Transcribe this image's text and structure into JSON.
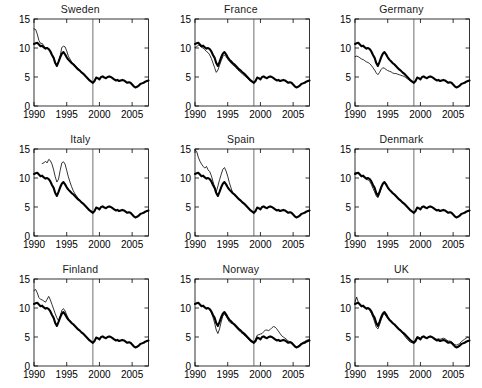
{
  "figure": {
    "panel_order": [
      "Sweden",
      "France",
      "Germany",
      "Italy",
      "Spain",
      "Denmark",
      "Finland",
      "Norway",
      "UK"
    ],
    "rows": 3,
    "cols": 3
  },
  "axes": {
    "xlim": [
      1990,
      2007.5
    ],
    "ylim": [
      0,
      15
    ],
    "xticks": [
      1990,
      1995,
      2000,
      2005
    ],
    "xticklabels": [
      "1990",
      "1995",
      "2000",
      "2005"
    ],
    "yticks": [
      0,
      5,
      10,
      15
    ],
    "yticklabels": [
      "0",
      "5",
      "10",
      "15"
    ],
    "grid": false,
    "box": true,
    "vertical_reference_line": 1999
  },
  "style": {
    "thick_color": "#000000",
    "thin_color": "#000000",
    "vline_color": "#4a4a4a",
    "thick_width": 2.1,
    "thin_width": 0.8,
    "background": "#ffffff"
  },
  "chart_data": {
    "type": "line",
    "title": "",
    "xlabel": "",
    "ylabel": "",
    "xlim": [
      1990,
      2007.5
    ],
    "ylim": [
      0,
      15
    ],
    "legend_position": "none",
    "annotations": [
      {
        "type": "vline",
        "x": 1999,
        "label": "1999"
      }
    ],
    "x": [
      1990.0,
      1990.25,
      1990.5,
      1990.75,
      1991.0,
      1991.25,
      1991.5,
      1991.75,
      1992.0,
      1992.25,
      1992.5,
      1992.75,
      1993.0,
      1993.25,
      1993.5,
      1993.75,
      1994.0,
      1994.25,
      1994.5,
      1994.75,
      1995.0,
      1995.25,
      1995.5,
      1995.75,
      1996.0,
      1996.25,
      1996.5,
      1996.75,
      1997.0,
      1997.25,
      1997.5,
      1997.75,
      1998.0,
      1998.25,
      1998.5,
      1998.75,
      1999.0,
      1999.25,
      1999.5,
      1999.75,
      2000.0,
      2000.25,
      2000.5,
      2000.75,
      2001.0,
      2001.25,
      2001.5,
      2001.75,
      2002.0,
      2002.25,
      2002.5,
      2002.75,
      2003.0,
      2003.25,
      2003.5,
      2003.75,
      2004.0,
      2004.25,
      2004.5,
      2004.75,
      2005.0,
      2005.25,
      2005.5,
      2005.75,
      2006.0,
      2006.25,
      2006.5,
      2006.75,
      2007.0,
      2007.25,
      2007.5
    ],
    "benchmark_series": {
      "name": "benchmark (thick)",
      "note": "identical in all nine panels",
      "values": [
        10.7,
        10.8,
        10.9,
        10.6,
        10.3,
        10.4,
        10.1,
        9.9,
        10.0,
        9.8,
        9.4,
        8.8,
        8.3,
        7.4,
        6.9,
        7.6,
        8.4,
        9.0,
        9.3,
        8.9,
        8.4,
        8.0,
        7.7,
        7.4,
        7.2,
        6.9,
        6.6,
        6.3,
        6.1,
        5.8,
        5.6,
        5.3,
        5.0,
        4.7,
        4.4,
        4.2,
        4.0,
        4.3,
        4.9,
        4.8,
        4.6,
        5.0,
        5.1,
        4.9,
        4.8,
        5.0,
        5.1,
        5.0,
        4.8,
        4.6,
        4.4,
        4.5,
        4.3,
        4.4,
        4.5,
        4.4,
        4.2,
        4.0,
        4.1,
        4.0,
        3.7,
        3.4,
        3.2,
        3.3,
        3.5,
        3.8,
        3.9,
        4.0,
        4.2,
        4.3,
        4.4
      ]
    },
    "panels": [
      {
        "title": "Sweden",
        "series": [
          {
            "name": "Sweden (thin)",
            "x_start": 1990.0,
            "x_end": 1999.0,
            "values": [
              13.3,
              13.2,
              12.4,
              11.3,
              10.8,
              10.8,
              10.4,
              10.0,
              10.1,
              9.9,
              9.5,
              8.9,
              8.4,
              7.5,
              7.0,
              7.7,
              8.6,
              10.1,
              10.3,
              10.2,
              9.5,
              8.6,
              8.1,
              7.6,
              7.3,
              7.0,
              6.7,
              6.4,
              6.2,
              5.9,
              5.7,
              5.4,
              5.1,
              4.8,
              4.5,
              4.3,
              4.0
            ]
          }
        ]
      },
      {
        "title": "France",
        "series": [
          {
            "name": "France (thin)",
            "x_start": 1990.0,
            "x_end": 1999.0,
            "values": [
              10.1,
              10.2,
              10.5,
              10.4,
              10.1,
              10.0,
              9.7,
              9.4,
              9.2,
              8.8,
              8.2,
              7.4,
              6.6,
              5.8,
              6.2,
              7.0,
              7.8,
              8.5,
              8.8,
              8.5,
              8.1,
              7.7,
              7.4,
              7.1,
              6.9,
              6.6,
              6.3,
              6.0,
              5.8,
              5.5,
              5.3,
              5.0,
              4.8,
              4.5,
              4.3,
              4.1,
              4.0
            ]
          }
        ]
      },
      {
        "title": "Germany",
        "series": [
          {
            "name": "Germany (thin)",
            "x_start": 1990.0,
            "x_end": 1999.0,
            "values": [
              8.5,
              8.6,
              8.5,
              8.3,
              8.1,
              8.0,
              7.8,
              7.6,
              7.5,
              7.3,
              7.0,
              6.6,
              6.2,
              5.7,
              5.4,
              5.8,
              6.3,
              6.6,
              6.5,
              6.3,
              6.1,
              6.0,
              5.9,
              5.7,
              5.6,
              5.6,
              5.5,
              5.4,
              5.3,
              5.2,
              5.1,
              4.9,
              4.7,
              4.5,
              4.3,
              4.1,
              4.0
            ]
          }
        ]
      },
      {
        "title": "Italy",
        "series": [
          {
            "name": "Italy (thin)",
            "x_start": 1991.25,
            "x_end": 1999.0,
            "values": [
              12.5,
              12.6,
              12.9,
              12.6,
              13.2,
              13.0,
              12.4,
              11.4,
              10.2,
              9.3,
              9.8,
              11.3,
              12.6,
              12.8,
              12.4,
              11.3,
              10.2,
              9.3,
              8.5,
              7.8,
              7.3,
              6.9,
              6.5,
              6.2,
              5.9,
              5.6,
              5.3,
              5.0,
              4.8,
              4.5,
              4.3,
              4.1
            ]
          }
        ]
      },
      {
        "title": "Spain",
        "series": [
          {
            "name": "Spain (thin)",
            "x_start": 1990.0,
            "x_end": 1999.0,
            "values": [
              14.8,
              14.6,
              13.6,
              12.9,
              12.4,
              12.0,
              11.7,
              12.0,
              11.4,
              11.1,
              10.4,
              9.4,
              8.4,
              7.6,
              8.6,
              9.7,
              10.6,
              11.5,
              11.8,
              11.2,
              10.3,
              9.2,
              8.3,
              7.5,
              7.1,
              6.8,
              6.5,
              6.2,
              6.0,
              5.7,
              5.5,
              5.2,
              5.0,
              4.7,
              4.4,
              4.2,
              4.0
            ]
          }
        ]
      },
      {
        "title": "Denmark",
        "series": [
          {
            "name": "Denmark (thin)",
            "x_start": 1990.0,
            "x_end": 1999.0,
            "values": [
              10.9,
              10.9,
              10.8,
              10.5,
              10.2,
              10.3,
              10.0,
              9.7,
              9.7,
              9.4,
              8.9,
              8.2,
              7.6,
              6.9,
              6.6,
              7.3,
              8.2,
              8.9,
              9.2,
              8.8,
              8.3,
              7.9,
              7.6,
              7.3,
              7.1,
              6.8,
              6.5,
              6.2,
              6.0,
              5.7,
              5.5,
              5.2,
              5.0,
              4.7,
              4.4,
              4.2,
              4.0
            ]
          }
        ]
      },
      {
        "title": "Finland",
        "series": [
          {
            "name": "Finland (thin)",
            "x_start": 1990.0,
            "x_end": 1999.0,
            "values": [
              13.0,
              13.2,
              12.6,
              11.8,
              11.5,
              11.4,
              11.2,
              11.0,
              11.5,
              12.0,
              11.4,
              10.6,
              9.8,
              9.0,
              8.3,
              7.8,
              8.5,
              9.6,
              9.9,
              9.5,
              8.8,
              8.2,
              7.8,
              7.5,
              7.2,
              6.9,
              6.6,
              6.3,
              6.1,
              5.8,
              5.6,
              5.3,
              5.0,
              4.8,
              4.5,
              4.2,
              4.0
            ]
          }
        ]
      },
      {
        "title": "Norway",
        "series": [
          {
            "name": "Norway (thin)",
            "x_start": 1990.0,
            "x_end": 2007.5,
            "values": [
              10.7,
              10.8,
              10.9,
              10.6,
              10.3,
              10.4,
              10.1,
              9.9,
              10.0,
              9.7,
              9.2,
              8.4,
              7.4,
              6.2,
              5.6,
              6.4,
              7.6,
              8.6,
              9.0,
              8.6,
              8.1,
              7.6,
              7.4,
              7.3,
              7.0,
              6.7,
              6.4,
              6.1,
              5.8,
              5.6,
              5.3,
              5.1,
              4.8,
              4.5,
              4.2,
              4.1,
              4.1,
              4.6,
              5.3,
              5.4,
              5.5,
              5.6,
              5.9,
              6.2,
              6.2,
              6.1,
              6.3,
              6.6,
              6.8,
              6.7,
              6.4,
              6.0,
              5.6,
              5.2,
              5.0,
              4.8,
              4.6,
              4.3,
              4.2,
              4.1,
              3.8,
              3.5,
              3.3,
              3.4,
              3.6,
              3.9,
              4.1,
              4.2,
              4.4,
              4.5,
              4.6
            ]
          }
        ]
      },
      {
        "title": "UK",
        "series": [
          {
            "name": "UK (thin)",
            "x_start": 1990.0,
            "x_end": 2007.5,
            "values": [
              11.0,
              11.9,
              11.0,
              10.5,
              10.2,
              10.3,
              10.0,
              9.8,
              9.9,
              9.6,
              9.1,
              8.4,
              7.6,
              6.7,
              6.4,
              7.1,
              8.0,
              8.7,
              9.0,
              8.6,
              8.2,
              7.8,
              7.6,
              7.4,
              7.2,
              6.9,
              6.6,
              6.3,
              6.0,
              5.7,
              5.3,
              4.9,
              4.6,
              4.3,
              4.1,
              4.0,
              4.1,
              4.6,
              5.1,
              5.0,
              4.8,
              5.0,
              5.1,
              4.9,
              4.8,
              5.0,
              5.1,
              5.0,
              4.9,
              4.7,
              4.6,
              4.7,
              4.6,
              4.7,
              4.8,
              4.7,
              4.5,
              4.3,
              4.3,
              4.2,
              3.9,
              3.7,
              3.6,
              3.7,
              3.9,
              4.2,
              4.4,
              4.6,
              4.8,
              5.0,
              4.7
            ]
          }
        ]
      }
    ]
  }
}
